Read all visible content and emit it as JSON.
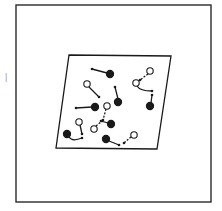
{
  "colors": {
    "background": "#ffffff",
    "ink": "#1a1a1a",
    "frame": "#2a2a2a"
  },
  "frame": {
    "x": 16,
    "y": 5,
    "w": 195,
    "h": 197
  },
  "plate": {
    "points": [
      [
        69,
        55
      ],
      [
        171,
        56
      ],
      [
        157,
        149
      ],
      [
        56,
        148
      ]
    ]
  },
  "particles": [
    {
      "type": "filled",
      "cx": 110,
      "cy": 74
    },
    {
      "type": "open",
      "cx": 87,
      "cy": 84
    },
    {
      "type": "filled",
      "cx": 118,
      "cy": 102
    },
    {
      "type": "filled",
      "cx": 95,
      "cy": 107
    },
    {
      "type": "open",
      "cx": 107,
      "cy": 106
    },
    {
      "type": "open",
      "cx": 150,
      "cy": 71
    },
    {
      "type": "open",
      "cx": 136,
      "cy": 83
    },
    {
      "type": "filled",
      "cx": 150,
      "cy": 106
    },
    {
      "type": "filled",
      "cx": 111,
      "cy": 124
    },
    {
      "type": "open",
      "cx": 79,
      "cy": 122
    },
    {
      "type": "open",
      "cx": 94,
      "cy": 129
    },
    {
      "type": "filled",
      "cx": 67,
      "cy": 134
    },
    {
      "type": "filled",
      "cx": 106,
      "cy": 139
    },
    {
      "type": "open",
      "cx": 134,
      "cy": 135
    }
  ],
  "arrows": [
    {
      "d": "M107,73 L92,69",
      "head": [
        92,
        69
      ]
    },
    {
      "d": "M89,87 L99,97",
      "head": [
        99,
        97
      ]
    },
    {
      "d": "M118,99 L115,87",
      "head": [
        115,
        87
      ]
    },
    {
      "d": "M92,107 L76,108",
      "head": [
        76,
        108
      ]
    },
    {
      "d": "M106,109 L103,120",
      "head": [
        103,
        120
      ],
      "dashed": true
    },
    {
      "d": "M148,74 L140,80",
      "head": [
        140,
        80
      ],
      "dashed": true
    },
    {
      "d": "M137,86 Q140,91 152,91",
      "head": [
        152,
        91
      ]
    },
    {
      "d": "M151,103 L152,95",
      "head": [
        152,
        95
      ]
    },
    {
      "d": "M108,123 L101,121",
      "head": [
        101,
        121
      ]
    },
    {
      "d": "M80,125 L82,134",
      "head": [
        82,
        134
      ]
    },
    {
      "d": "M96,126 L102,121",
      "head": [
        102,
        121
      ],
      "dashed": true
    },
    {
      "d": "M69,137 Q72,142 82,138",
      "head": [
        82,
        138
      ]
    },
    {
      "d": "M109,141 L119,145",
      "head": [
        119,
        145
      ]
    },
    {
      "d": "M131,137 L124,143",
      "head": [
        124,
        143
      ],
      "dashed": true
    }
  ],
  "marks": {
    "left_tick": {
      "x": 5,
      "y": 80,
      "text": "|"
    }
  }
}
